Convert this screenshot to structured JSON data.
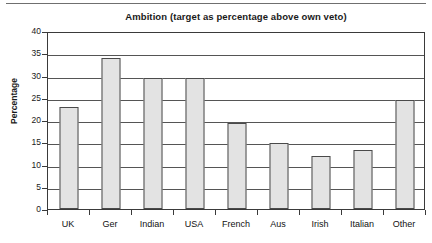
{
  "chart_data": {
    "type": "bar",
    "title": "Ambition (target as percentage above own veto)",
    "xlabel": "",
    "ylabel": "Percentage",
    "categories": [
      "UK",
      "Ger",
      "Indian",
      "USA",
      "French",
      "Aus",
      "Irish",
      "Italian",
      "Other"
    ],
    "values": [
      23,
      34,
      29.5,
      29.5,
      19.3,
      14.8,
      12,
      13.2,
      24.5
    ],
    "ylim": [
      0,
      40
    ],
    "yticks": [
      0,
      5,
      10,
      15,
      20,
      25,
      30,
      35,
      40
    ],
    "ytick_labels": [
      "0",
      "5",
      "10",
      "15",
      "20",
      "25",
      "30",
      "35",
      "40"
    ],
    "grid": true,
    "legend": null,
    "bar_color": "#e3e3e3",
    "bar_edge_color": "#4a4a4a",
    "axis_color": "#3a3a3a",
    "text_color": "#111111"
  }
}
